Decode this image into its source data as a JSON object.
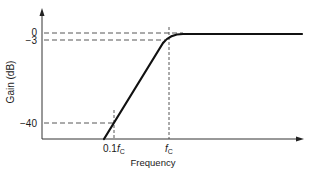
{
  "figure": {
    "type": "high-pass filter Bode magnitude plot (asymptotic)",
    "y_axis": {
      "label": "Gain (dB)",
      "ticks": [
        {
          "label": "0",
          "value": 0
        },
        {
          "label": "−3",
          "value": -3
        },
        {
          "label": "−40",
          "value": -40
        }
      ]
    },
    "x_axis": {
      "label": "Frequency",
      "ticks": [
        {
          "label_main": "0.1",
          "label_f": "f",
          "label_sub": "C"
        },
        {
          "label_main": "",
          "label_f": "f",
          "label_sub": "C"
        }
      ]
    },
    "curve": {
      "description": "Gain rises at constant slope from low frequency, passes −40 dB at 0.1fC, −3 dB at fC, then flattens at 0 dB",
      "points": [
        {
          "freq": "below 0.1fC",
          "gain_db": "< -40"
        },
        {
          "freq": "0.1fC",
          "gain_db": -40
        },
        {
          "freq": "fC",
          "gain_db": -3
        },
        {
          "freq": "above fC",
          "gain_db": 0
        }
      ]
    },
    "colors": {
      "line": "#111111",
      "dashed": "#333333",
      "background": "#ffffff"
    }
  }
}
